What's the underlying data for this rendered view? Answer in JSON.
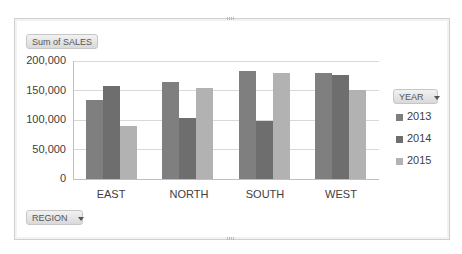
{
  "chart_data": {
    "type": "bar",
    "title": "",
    "xlabel": "",
    "ylabel": "",
    "categories": [
      "EAST",
      "NORTH",
      "SOUTH",
      "WEST"
    ],
    "series": [
      {
        "name": "2013",
        "color": "#7f7f7f",
        "values": [
          134000,
          164000,
          183000,
          180000
        ]
      },
      {
        "name": "2014",
        "color": "#6e6e6e",
        "values": [
          158000,
          103000,
          98000,
          176000
        ]
      },
      {
        "name": "2015",
        "color": "#b2b2b2",
        "values": [
          90000,
          154000,
          180000,
          151000
        ]
      }
    ],
    "ylim": [
      0,
      200000
    ],
    "yticks": [
      "0",
      "50,000",
      "100,000",
      "150,000",
      "200,000"
    ],
    "grid": true,
    "legend_position": "right"
  },
  "pivot": {
    "values_button": "Sum of SALES",
    "legend_field_button": "YEAR",
    "axis_field_button": "REGION"
  }
}
